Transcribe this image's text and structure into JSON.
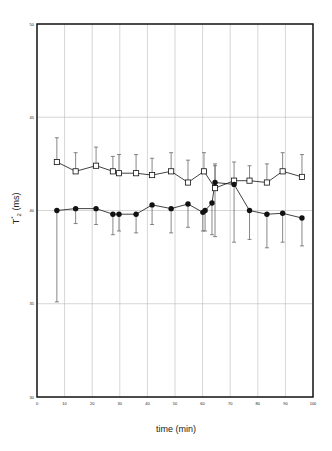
{
  "chart_data": {
    "type": "line",
    "title": "",
    "xlabel": "time (min)",
    "ylabel": "T2* (ms)",
    "ylabel_parts": {
      "base": "T",
      "sub": "2",
      "sup": "*",
      "unit": " (ms)"
    },
    "xlim": [
      0,
      100
    ],
    "ylim": [
      30,
      50
    ],
    "xticks": [
      0,
      10,
      20,
      30,
      40,
      50,
      60,
      70,
      80,
      90,
      100
    ],
    "yticks": [
      30,
      35,
      40,
      45,
      50
    ],
    "grid": true,
    "legend": null,
    "series": [
      {
        "name": "open squares",
        "marker": "square-open",
        "x": [
          7.2,
          14.0,
          21.4,
          27.5,
          29.7,
          35.9,
          41.7,
          48.6,
          54.7,
          60.5,
          64.5,
          71.4,
          77.0,
          83.3,
          89.0,
          96.0
        ],
        "y": [
          42.6,
          42.1,
          42.4,
          42.1,
          42.0,
          42.0,
          41.9,
          42.1,
          41.5,
          42.1,
          41.2,
          41.6,
          41.6,
          41.5,
          42.1,
          41.8
        ],
        "err_upper": [
          43.9,
          43.1,
          43.4,
          42.9,
          43.0,
          43.0,
          42.8,
          43.1,
          42.7,
          43.1,
          42.5,
          42.6,
          42.4,
          42.5,
          43.1,
          43.0
        ],
        "err_lower": [
          42.6,
          42.1,
          42.4,
          42.1,
          42.0,
          42.0,
          41.9,
          42.1,
          41.5,
          42.1,
          41.2,
          41.6,
          41.6,
          41.5,
          42.1,
          41.8
        ]
      },
      {
        "name": "filled circles",
        "marker": "circle-filled",
        "x": [
          7.2,
          14.0,
          21.4,
          27.5,
          29.7,
          35.9,
          41.7,
          48.6,
          54.7,
          60.1,
          60.9,
          63.4,
          64.5,
          71.4,
          77.0,
          83.3,
          89.0,
          96.0
        ],
        "y": [
          40.0,
          40.1,
          40.1,
          39.8,
          39.8,
          39.8,
          40.3,
          40.1,
          40.35,
          39.9,
          40.0,
          40.4,
          41.5,
          41.4,
          40.0,
          39.8,
          39.85,
          39.6
        ],
        "err_upper": [
          40.0,
          40.1,
          40.1,
          39.8,
          39.8,
          39.8,
          40.3,
          40.1,
          40.35,
          39.9,
          40.0,
          40.4,
          42.4,
          41.4,
          40.0,
          39.8,
          39.85,
          39.6
        ],
        "err_lower": [
          35.1,
          39.3,
          39.25,
          38.7,
          38.9,
          38.8,
          39.25,
          38.8,
          39.1,
          38.9,
          38.9,
          38.7,
          38.6,
          38.3,
          38.45,
          38.0,
          38.3,
          38.1
        ]
      }
    ]
  },
  "plot_box": {
    "left": 37,
    "top": 24,
    "right": 313,
    "bottom": 397
  },
  "colors": {
    "axis": "#111111",
    "grid": "#bbbbbb",
    "series": "#111111",
    "errorbar": "#555555"
  }
}
